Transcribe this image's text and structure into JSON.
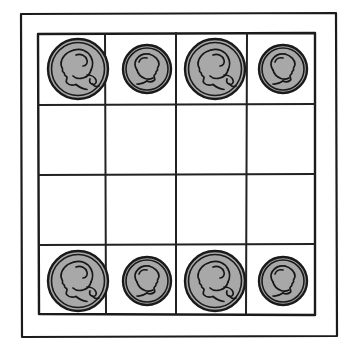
{
  "figure": {
    "background_color": "#ffffff",
    "ink_color": "#1b1b1b",
    "coin_fill_color": "#a8a8a8",
    "coin_outline_color": "#1a1a1a"
  },
  "frame": {
    "name": "outer-frame",
    "x": 21,
    "y": 13,
    "width": 316,
    "height": 324
  },
  "grid": {
    "name": "coin-grid",
    "rows": 4,
    "columns": 4,
    "x": 38,
    "y": 33,
    "width": 277,
    "height": 282,
    "column_line_x": [
      105,
      176,
      247
    ],
    "row_line_y": [
      105,
      175,
      245
    ],
    "cells": [
      [
        {
          "row": 1,
          "column": 1,
          "coin": "quarter",
          "occupied": true
        },
        {
          "row": 1,
          "column": 2,
          "coin": "penny",
          "occupied": true
        },
        {
          "row": 1,
          "column": 3,
          "coin": "quarter",
          "occupied": true
        },
        {
          "row": 1,
          "column": 4,
          "coin": "penny",
          "occupied": true
        }
      ],
      [
        {
          "row": 2,
          "column": 1,
          "coin": null,
          "occupied": false
        },
        {
          "row": 2,
          "column": 2,
          "coin": null,
          "occupied": false
        },
        {
          "row": 2,
          "column": 3,
          "coin": null,
          "occupied": false
        },
        {
          "row": 2,
          "column": 4,
          "coin": null,
          "occupied": false
        }
      ],
      [
        {
          "row": 3,
          "column": 1,
          "coin": null,
          "occupied": false
        },
        {
          "row": 3,
          "column": 2,
          "coin": null,
          "occupied": false
        },
        {
          "row": 3,
          "column": 3,
          "coin": null,
          "occupied": false
        },
        {
          "row": 3,
          "column": 4,
          "coin": null,
          "occupied": false
        }
      ],
      [
        {
          "row": 4,
          "column": 1,
          "coin": "quarter",
          "occupied": true
        },
        {
          "row": 4,
          "column": 2,
          "coin": "penny",
          "occupied": true
        },
        {
          "row": 4,
          "column": 3,
          "coin": "quarter",
          "occupied": true
        },
        {
          "row": 4,
          "column": 4,
          "coin": "penny",
          "occupied": true
        }
      ]
    ]
  },
  "coin_types": {
    "quarter": {
      "label": "quarter",
      "icon_name": "quarter-coin-icon",
      "portrait": "Washington profile facing left",
      "facing": "left",
      "radius": 30,
      "size": "large"
    },
    "penny": {
      "label": "penny",
      "icon_name": "penny-coin-icon",
      "portrait": "Lincoln profile facing right",
      "facing": "right",
      "radius": 24,
      "size": "small"
    }
  },
  "coin_placements": [
    {
      "id": "coin-r1c1",
      "type": "quarter",
      "cx": 78,
      "cy": 69,
      "r": 30
    },
    {
      "id": "coin-r1c2",
      "type": "penny",
      "cx": 147,
      "cy": 69,
      "r": 24
    },
    {
      "id": "coin-r1c3",
      "type": "quarter",
      "cx": 215,
      "cy": 69,
      "r": 30
    },
    {
      "id": "coin-r1c4",
      "type": "penny",
      "cx": 283,
      "cy": 69,
      "r": 24
    },
    {
      "id": "coin-r4c1",
      "type": "quarter",
      "cx": 78,
      "cy": 281,
      "r": 30
    },
    {
      "id": "coin-r4c2",
      "type": "penny",
      "cx": 147,
      "cy": 281,
      "r": 24
    },
    {
      "id": "coin-r4c3",
      "type": "quarter",
      "cx": 215,
      "cy": 281,
      "r": 30
    },
    {
      "id": "coin-r4c4",
      "type": "penny",
      "cx": 283,
      "cy": 281,
      "r": 24
    }
  ]
}
